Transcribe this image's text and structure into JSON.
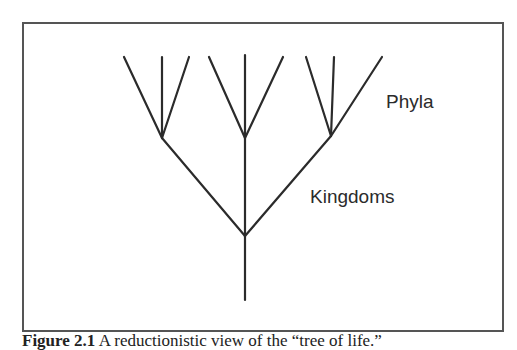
{
  "figure": {
    "labels": {
      "phyla": "Phyla",
      "kingdoms": "Kingdoms"
    },
    "caption": {
      "label": "Figure 2.1",
      "text": "  A reductionistic view of the “tree of life.”"
    },
    "colors": {
      "line": "#2b2b2b",
      "frame": "#555555",
      "background": "#ffffff"
    },
    "tree": {
      "root": {
        "x": 245,
        "y": 300
      },
      "kingdom_node": {
        "x": 245,
        "y": 236
      },
      "phylum_nodes": [
        {
          "name": "left",
          "x": 162,
          "y": 138,
          "tips": [
            [
              124,
              57
            ],
            [
              162,
              57
            ],
            [
              189,
              57
            ]
          ]
        },
        {
          "name": "middle",
          "x": 245,
          "y": 138,
          "tips": [
            [
              209,
              57
            ],
            [
              245,
              55
            ],
            [
              283,
              57
            ]
          ]
        },
        {
          "name": "right",
          "x": 331,
          "y": 136,
          "tips": [
            [
              306,
              57
            ],
            [
              334,
              57
            ],
            [
              382,
              57
            ]
          ]
        }
      ]
    }
  }
}
